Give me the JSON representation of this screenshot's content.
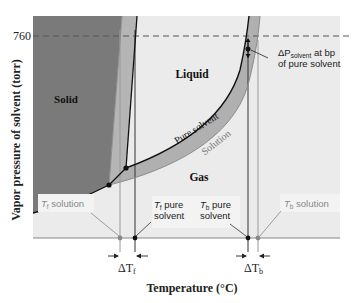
{
  "figure": {
    "y_axis_label": "Vapor pressure of solvent (torr)",
    "x_axis_label": "Temperature (°C)",
    "y_tick_760": "760",
    "regions": {
      "solid": "Solid",
      "liquid": "Liquid",
      "gas": "Gas"
    },
    "curve_labels": {
      "pure_solvent": "Pure solvent",
      "solution": "Solution"
    },
    "annotations": {
      "delta_p_main": "ΔP",
      "delta_p_sub": "solvent",
      "delta_p_rest": " at bp",
      "delta_p_line2": "of pure solvent",
      "tf_solution_T": "T",
      "tf_solution_sub": "f",
      "tf_solution_text": " solution",
      "tf_pure_T": "T",
      "tf_pure_sub": "f",
      "tf_pure_text1": " pure",
      "tf_pure_text2": "solvent",
      "tb_pure_T": "T",
      "tb_pure_sub": "b",
      "tb_pure_text1": " pure",
      "tb_pure_text2": "solvent",
      "tb_solution_T": "T",
      "tb_solution_sub": "b",
      "tb_solution_text": " solution",
      "delta_tf": "ΔT",
      "delta_tf_sub": "f",
      "delta_tb": "ΔT",
      "delta_tb_sub": "b"
    },
    "colors": {
      "solid_fill": "#7a7a7a",
      "band_fill": "#b0b0b0",
      "liquid_gas_bg": "#ececec",
      "pure_line": "#111111",
      "solution_line": "#8c8c8c",
      "label_box": "#f4f4f4"
    }
  }
}
